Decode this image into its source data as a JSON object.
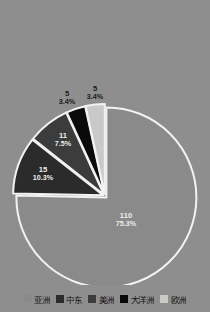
{
  "chart_data": {
    "type": "pie",
    "title": "",
    "categories": [
      "亚洲",
      "中东",
      "美洲",
      "大洋洲",
      "欧洲"
    ],
    "values": [
      110,
      15,
      11,
      5,
      5
    ],
    "percent_labels": [
      "75.3%",
      "10.3%",
      "7.5%",
      "3.4%",
      "3.4%"
    ],
    "value_labels": [
      "110",
      "15",
      "11",
      "5",
      "5"
    ],
    "total": 146,
    "colors": [
      "#8a8a8a",
      "#2b2b2b",
      "#3c3c3c",
      "#0a0a0a",
      "#c9c9c9"
    ],
    "legend_position": "bottom",
    "grid": false,
    "start_angle_deg": 0,
    "direction": "clockwise",
    "slice_border_color": "#f2f2f2",
    "background_color": "#8e8e8e",
    "slices": [
      {
        "name": "亚洲",
        "value": 110,
        "value_label": "110",
        "percent": "75.3%",
        "color": "#8a8a8a",
        "label_color": "light"
      },
      {
        "name": "中东",
        "value": 15,
        "value_label": "15",
        "percent": "10.3%",
        "color": "#2b2b2b",
        "label_color": "light"
      },
      {
        "name": "美洲",
        "value": 11,
        "value_label": "11",
        "percent": "7.5%",
        "color": "#3c3c3c",
        "label_color": "light"
      },
      {
        "name": "大洋洲",
        "value": 5,
        "value_label": "5",
        "percent": "3.4%",
        "color": "#0a0a0a",
        "label_color": "dark"
      },
      {
        "name": "欧洲",
        "value": 5,
        "value_label": "5",
        "percent": "3.4%",
        "color": "#c9c9c9",
        "label_color": "dark"
      }
    ]
  },
  "legend": {
    "items": [
      {
        "label": "亚洲",
        "color": "#8a8a8a"
      },
      {
        "label": "中东",
        "color": "#2b2b2b"
      },
      {
        "label": "美洲",
        "color": "#3c3c3c"
      },
      {
        "label": "大洋洲",
        "color": "#0a0a0a"
      },
      {
        "label": "欧洲",
        "color": "#c9c9c9"
      }
    ]
  }
}
